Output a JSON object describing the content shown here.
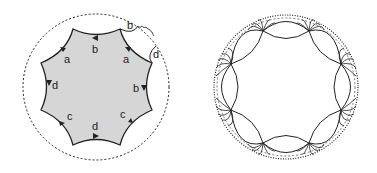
{
  "left_figure": {
    "description": "Fundamental octagon with edge identifications",
    "fill_color": "#d6d6d6",
    "labels": {
      "top": "b",
      "upper_left": "a",
      "upper_right": "a",
      "left": "d",
      "right": "b",
      "lower_left": "c",
      "lower_right": "c",
      "bottom": "d",
      "outside_b": "b",
      "outside_d": "d"
    }
  },
  "right_figure": {
    "description": "Hyperbolic tiling of the disk by geodesic arcs"
  }
}
